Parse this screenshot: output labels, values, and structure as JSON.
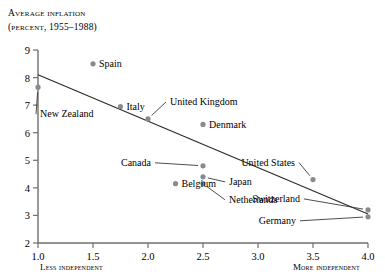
{
  "chart_data": {
    "type": "scatter",
    "title": "Average inflation",
    "subtitle": "(percent, 1955–1988)",
    "xlabel": "",
    "ylabel": "",
    "xlim": [
      1.0,
      4.0
    ],
    "ylim": [
      2,
      9
    ],
    "grid": false,
    "legend": "none",
    "xticks": [
      "1.0",
      "1.5",
      "2.0",
      "2.5",
      "3.0",
      "3.5",
      "4.0"
    ],
    "xtick_values": [
      1.0,
      1.5,
      2.0,
      2.5,
      3.0,
      3.5,
      4.0
    ],
    "yticks": [
      "2",
      "3",
      "4",
      "5",
      "6",
      "7",
      "8",
      "9"
    ],
    "ytick_values": [
      2,
      3,
      4,
      5,
      6,
      7,
      8,
      9
    ],
    "x_axis_left_caption": "Less independent",
    "x_axis_right_caption": "More independent",
    "marker_color": "#8a8a8a",
    "line_color": "#2b2b2b",
    "axis_color": "#6f6f6f",
    "points": [
      {
        "label": "Spain",
        "x": 1.5,
        "y": 8.5,
        "label_dx": 6,
        "label_dy": 3.5,
        "leader": false
      },
      {
        "label": "New Zealand",
        "x": 1.0,
        "y": 7.65,
        "label_dx": 2,
        "label_dy": 30,
        "leader": true
      },
      {
        "label": "Italy",
        "x": 1.75,
        "y": 6.95,
        "label_dx": 6,
        "label_dy": 3.5,
        "leader": false
      },
      {
        "label": "United Kingdom",
        "x": 2.0,
        "y": 6.5,
        "label_dx": 22,
        "label_dy": -14,
        "leader": true
      },
      {
        "label": "Denmark",
        "x": 2.5,
        "y": 6.3,
        "label_dx": 6,
        "label_dy": 3.5,
        "leader": false
      },
      {
        "label": "Canada",
        "x": 2.5,
        "y": 4.8,
        "label_dx": -52,
        "label_dy": 0,
        "leader": true
      },
      {
        "label": "Belgium",
        "x": 2.25,
        "y": 4.15,
        "label_dx": 6,
        "label_dy": 3.5,
        "leader": false
      },
      {
        "label": "Japan",
        "x": 2.5,
        "y": 4.4,
        "label_dx": 26,
        "label_dy": 8,
        "leader": true
      },
      {
        "label": "Netherlands",
        "x": 2.5,
        "y": 4.15,
        "label_dx": 26,
        "label_dy": 19,
        "leader": true
      },
      {
        "label": "United States",
        "x": 3.5,
        "y": 4.3,
        "label_dx": -18,
        "label_dy": -14,
        "leader": true
      },
      {
        "label": "Switzerland",
        "x": 4.0,
        "y": 3.2,
        "label_dx": -68,
        "label_dy": -8,
        "leader": true
      },
      {
        "label": "Germany",
        "x": 4.0,
        "y": 2.95,
        "label_dx": -72,
        "label_dy": 7,
        "leader": true
      }
    ],
    "trend_line": {
      "x1": 1.0,
      "y1": 8.1,
      "x2": 4.0,
      "y2": 3.05
    }
  }
}
